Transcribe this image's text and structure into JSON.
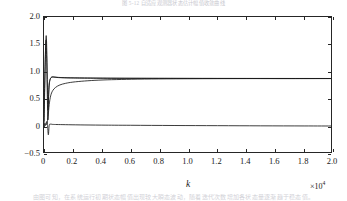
{
  "figure": {
    "scan_artifacts": {
      "top_caption_fragment": "图 5-12  自适应观测器状态估计幅值收敛曲线",
      "bottom_caption_fragment": "由图可知，在系统运行初期状态幅值出现较大瞬态波动，随着迭代次数增加各状态量逐渐趋于稳态值。"
    }
  },
  "chart_data": {
    "type": "line",
    "title": "",
    "xlabel": "k",
    "ylabel": "状态幅值",
    "x_multiplier": "×10⁴",
    "x_multiplier_base": "×10",
    "x_multiplier_exp": "4",
    "xlim": [
      0,
      2.0
    ],
    "ylim": [
      -0.5,
      2.0
    ],
    "xticks": [
      0,
      0.2,
      0.4,
      0.6,
      0.8,
      1.0,
      1.2,
      1.4,
      1.6,
      1.8,
      2.0
    ],
    "xticklabels": [
      "0",
      "0.2",
      "0.4",
      "0.6",
      "0.8",
      "1.0",
      "1.2",
      "1.4",
      "1.6",
      "1.8",
      "2.0"
    ],
    "yticks": [
      -0.5,
      0,
      0.5,
      1.0,
      1.5,
      2.0
    ],
    "yticklabels": [
      "−0.5",
      "0",
      "0.5",
      "1.0",
      "1.5",
      "2.0"
    ],
    "grid": false,
    "legend": false,
    "legend_position": "none",
    "line_color": "#1a1a1a",
    "series": [
      {
        "name": "state-1-overshoot",
        "color": "#1a1a1a",
        "steady_state": 0.88,
        "peak": 1.65,
        "points": [
          [
            0.0,
            0.0
          ],
          [
            0.004,
            0.55
          ],
          [
            0.008,
            1.1
          ],
          [
            0.012,
            1.52
          ],
          [
            0.016,
            1.65
          ],
          [
            0.02,
            1.3
          ],
          [
            0.024,
            0.72
          ],
          [
            0.028,
            0.3
          ],
          [
            0.034,
            0.72
          ],
          [
            0.042,
            0.86
          ],
          [
            0.055,
            0.905
          ],
          [
            0.075,
            0.9
          ],
          [
            0.11,
            0.893
          ],
          [
            0.18,
            0.888
          ],
          [
            0.3,
            0.884
          ],
          [
            0.5,
            0.881
          ],
          [
            0.8,
            0.879
          ],
          [
            1.2,
            0.878
          ],
          [
            1.6,
            0.877
          ],
          [
            2.0,
            0.877
          ]
        ]
      },
      {
        "name": "state-2-slow-rise",
        "color": "#1a1a1a",
        "steady_state": 0.875,
        "peak": 0.875,
        "points": [
          [
            0.0,
            0.0
          ],
          [
            0.01,
            0.02
          ],
          [
            0.02,
            0.06
          ],
          [
            0.028,
            0.18
          ],
          [
            0.036,
            0.4
          ],
          [
            0.046,
            0.56
          ],
          [
            0.06,
            0.655
          ],
          [
            0.08,
            0.715
          ],
          [
            0.11,
            0.76
          ],
          [
            0.15,
            0.79
          ],
          [
            0.2,
            0.812
          ],
          [
            0.28,
            0.832
          ],
          [
            0.38,
            0.848
          ],
          [
            0.5,
            0.858
          ],
          [
            0.65,
            0.866
          ],
          [
            0.85,
            0.871
          ],
          [
            1.1,
            0.874
          ],
          [
            1.4,
            0.876
          ],
          [
            1.7,
            0.876
          ],
          [
            2.0,
            0.877
          ]
        ]
      },
      {
        "name": "state-3-near-zero",
        "color": "#1a1a1a",
        "steady_state": 0.01,
        "peak": -0.15,
        "points": [
          [
            0.0,
            0.0
          ],
          [
            0.006,
            0.06
          ],
          [
            0.012,
            0.03
          ],
          [
            0.018,
            0.09
          ],
          [
            0.024,
            0.04
          ],
          [
            0.03,
            -0.15
          ],
          [
            0.036,
            0.02
          ],
          [
            0.044,
            0.045
          ],
          [
            0.06,
            0.04
          ],
          [
            0.09,
            0.038
          ],
          [
            0.15,
            0.035
          ],
          [
            0.25,
            0.031
          ],
          [
            0.4,
            0.027
          ],
          [
            0.6,
            0.024
          ],
          [
            0.9,
            0.02
          ],
          [
            1.2,
            0.017
          ],
          [
            1.5,
            0.014
          ],
          [
            1.8,
            0.012
          ],
          [
            2.0,
            0.011
          ]
        ]
      },
      {
        "name": "state-4-spike-trace",
        "color": "#1a1a1a",
        "steady_state": 0.885,
        "peak": 1.58,
        "points": [
          [
            0.0,
            0.1
          ],
          [
            0.004,
            0.7
          ],
          [
            0.009,
            1.25
          ],
          [
            0.014,
            1.58
          ],
          [
            0.019,
            1.18
          ],
          [
            0.023,
            0.55
          ],
          [
            0.027,
            0.12
          ],
          [
            0.031,
            0.5
          ],
          [
            0.038,
            0.8
          ],
          [
            0.05,
            0.895
          ],
          [
            0.07,
            0.905
          ],
          [
            0.1,
            0.898
          ],
          [
            0.16,
            0.892
          ],
          [
            0.28,
            0.888
          ],
          [
            0.46,
            0.884
          ],
          [
            0.75,
            0.882
          ],
          [
            1.1,
            0.88
          ],
          [
            1.5,
            0.879
          ],
          [
            2.0,
            0.878
          ]
        ]
      }
    ]
  }
}
